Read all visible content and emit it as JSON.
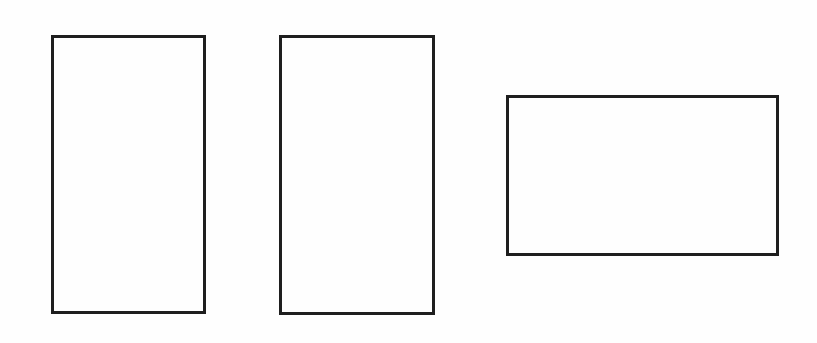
{
  "canvas": {
    "width": 817,
    "height": 343,
    "background": "#fefefe"
  },
  "stroke": {
    "color": "#1e1e1e",
    "width": 3
  },
  "shapes": [
    {
      "id": "rect-1",
      "type": "rectangle",
      "orientation": "portrait",
      "x": 51,
      "y": 35,
      "w": 155,
      "h": 279
    },
    {
      "id": "rect-2",
      "type": "rectangle",
      "orientation": "portrait",
      "x": 279,
      "y": 35,
      "w": 156,
      "h": 280
    },
    {
      "id": "rect-3",
      "type": "rectangle",
      "orientation": "landscape",
      "x": 506,
      "y": 95,
      "w": 273,
      "h": 161
    }
  ]
}
